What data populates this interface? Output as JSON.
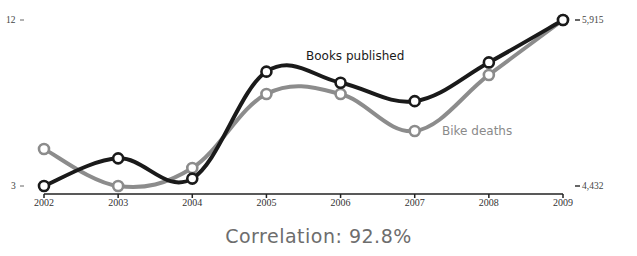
{
  "chart_data": {
    "type": "line",
    "title": "",
    "xlabel": "",
    "ylabel": "",
    "categories": [
      "2002",
      "2003",
      "2004",
      "2005",
      "2006",
      "2007",
      "2008",
      "2009"
    ],
    "series": [
      {
        "name": "Books published",
        "axis": "left",
        "color": "#1a1a1a",
        "values": [
          3.0,
          4.5,
          3.4,
          9.2,
          8.6,
          7.6,
          9.7,
          12.0
        ]
      },
      {
        "name": "Bike deaths",
        "axis": "right",
        "color": "#8c8c8c",
        "values": [
          4763,
          4432,
          4593,
          5254,
          5254,
          4923,
          5424,
          5915
        ]
      }
    ],
    "left_axis": {
      "ylim": [
        3,
        12
      ],
      "tick_labels": [
        "12",
        "3"
      ]
    },
    "right_axis": {
      "ylim": [
        4432,
        5915
      ],
      "tick_labels": [
        "5,915",
        "4,432"
      ]
    },
    "grid": false,
    "legend": "inline labels",
    "annotation": "Correlation: 92.8%"
  },
  "labels": {
    "left_top": "12",
    "left_bottom": "3",
    "right_top": "5,915",
    "right_bottom": "4,432",
    "books": "Books published",
    "bikes": "Bike deaths",
    "correlation": "Correlation: 92.8%"
  }
}
